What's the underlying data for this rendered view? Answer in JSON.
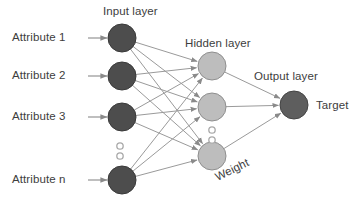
{
  "diagram": {
    "type": "neural-network-architecture",
    "layer_titles": {
      "input": "Input layer",
      "hidden": "Hidden layer",
      "output": "Output layer"
    },
    "edge_label": "Weight",
    "output_label": "Target",
    "input_labels": [
      "Attribute 1",
      "Attribute 2",
      "Attribute 3",
      "Attribute n"
    ],
    "vertical_ellipsis_symbol": "○",
    "colors": {
      "background": "#ffffff",
      "input_node_fill": "#4d4d4d",
      "input_node_stroke": "#3a3a3a",
      "hidden_node_fill": "#bdbdbd",
      "hidden_node_stroke": "#8f8f8f",
      "output_node_fill": "#5e5e5e",
      "output_node_stroke": "#444444",
      "edge": "#9a9a9a",
      "arrow": "#8a8a8a",
      "text": "#3d3d3d",
      "ellipsis_dot": "#a9a9a9"
    },
    "geometry": {
      "width": 361,
      "height": 207,
      "node_radius": 14,
      "ellipsis_dot_radius": 3.2,
      "input_nodes": [
        {
          "id": "i1",
          "cx": 122,
          "cy": 38
        },
        {
          "id": "i2",
          "cx": 122,
          "cy": 76
        },
        {
          "id": "i3",
          "cx": 122,
          "cy": 117
        },
        {
          "id": "i4",
          "cx": 122,
          "cy": 180
        }
      ],
      "hidden_nodes": [
        {
          "id": "h1",
          "cx": 212,
          "cy": 66
        },
        {
          "id": "h2",
          "cx": 212,
          "cy": 107
        },
        {
          "id": "h3",
          "cx": 212,
          "cy": 156
        }
      ],
      "output_nodes": [
        {
          "id": "o1",
          "cx": 294,
          "cy": 105
        }
      ],
      "input_ellipsis_dots": [
        {
          "cx": 120,
          "cy": 146
        },
        {
          "cx": 120,
          "cy": 156
        }
      ],
      "hidden_ellipsis_dots": [
        {
          "cx": 212,
          "cy": 130
        },
        {
          "cx": 212,
          "cy": 140
        }
      ],
      "input_arrows": [
        {
          "x1": 88,
          "y1": 38,
          "x2": 107,
          "y2": 38
        },
        {
          "x1": 88,
          "y1": 76,
          "x2": 107,
          "y2": 76
        },
        {
          "x1": 88,
          "y1": 117,
          "x2": 107,
          "y2": 117
        },
        {
          "x1": 88,
          "y1": 180,
          "x2": 107,
          "y2": 180
        }
      ],
      "input_to_hidden_edges": [
        {
          "from": "i1",
          "to": "h1"
        },
        {
          "from": "i1",
          "to": "h2"
        },
        {
          "from": "i1",
          "to": "h3"
        },
        {
          "from": "i2",
          "to": "h1"
        },
        {
          "from": "i2",
          "to": "h2"
        },
        {
          "from": "i2",
          "to": "h3"
        },
        {
          "from": "i3",
          "to": "h1"
        },
        {
          "from": "i3",
          "to": "h2"
        },
        {
          "from": "i3",
          "to": "h3"
        },
        {
          "from": "i4",
          "to": "h1"
        },
        {
          "from": "i4",
          "to": "h2"
        },
        {
          "from": "i4",
          "to": "h3"
        }
      ],
      "hidden_to_output_edges": [
        {
          "from": "h1",
          "to": "o1"
        },
        {
          "from": "h2",
          "to": "o1"
        },
        {
          "from": "h3",
          "to": "o1"
        }
      ],
      "label_positions": {
        "input_title": {
          "x": 103,
          "y": 5
        },
        "hidden_title": {
          "x": 185,
          "y": 37
        },
        "output_title": {
          "x": 254,
          "y": 70
        },
        "target": {
          "x": 316,
          "y": 99
        },
        "weight": {
          "x": 213,
          "y": 172
        },
        "attributes": [
          {
            "x": 12,
            "y": 31
          },
          {
            "x": 12,
            "y": 69
          },
          {
            "x": 12,
            "y": 110
          },
          {
            "x": 12,
            "y": 173
          }
        ]
      }
    }
  }
}
